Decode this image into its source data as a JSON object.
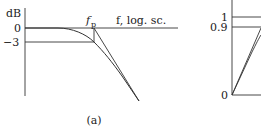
{
  "figure": {
    "panel_a": {
      "y_unit": "dB",
      "y_ticks": [
        "0",
        "−3"
      ],
      "pole_label_main": "f",
      "pole_label_sub": "p",
      "x_axis_label": "f, log. sc.",
      "caption": "(a)"
    },
    "panel_b": {
      "y_ticks": [
        "1",
        "0.9",
        "0"
      ]
    },
    "colors": {
      "line": "#333333",
      "text": "#222222"
    }
  }
}
